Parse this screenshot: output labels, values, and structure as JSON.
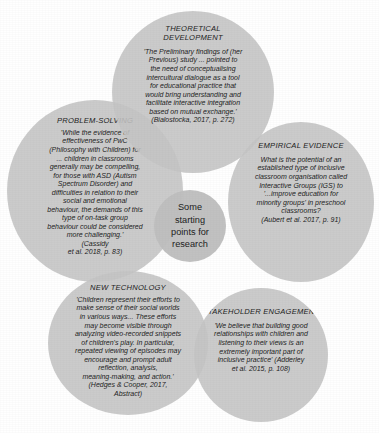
{
  "figure": {
    "center": {
      "label": "Some\nstarting\npoints for\nresearch"
    },
    "bubbles": [
      {
        "id": "theoretical-development",
        "heading": "THEORETICAL\nDEVELOPMENT",
        "quote": "'The Preliminary findings of (her\nPrevious) study ... pointed to\nthe need of conceptualising\nintercultural dialogue as a tool\nfor educational practice that\nwould bring understanding and\nfacilitate interactive integration\nbased on mutual exchange.'\n(Bialostocka, 2017, p. 272)"
      },
      {
        "id": "problem-solving",
        "heading": "PROBLEM-SOLVING",
        "quote": "'While the evidence of\neffectiveness of PwC\n(Philosophy with Children) for\n... children in classrooms\ngenerally may be compelling,\nfor those with ASD (Autism\nSpectrum Disorder) and\ndifficulties in relation to their\nsocial and emotional\nbehaviour, the demands of this\ntype of on-task group\nbehaviour could be considered\nmore challenging.'\n(Cassidy\net al. 2018, p. 83)"
      },
      {
        "id": "empirical-evidence",
        "heading": "EMPIRICAL EVIDENCE",
        "quote": "What is the potential of an\nestablished type of inclusive\nclassroom organisation called\nInteractive Groups (IGS) to\n'...improve education for\nminority groups' in preschool\nclassrooms?\n(Aubert et al. 2017, p. 91)"
      },
      {
        "id": "new-technology",
        "heading": "NEW TECHNOLOGY",
        "quote": "'Children represent their efforts to\nmake sense of their social worlds\nin various ways... These efforts\nmay become visible through\nanalyzing video-recorded snippets\nof children's play. In particular,\nrepeated viewing of episodes may\nencourage and prompt adult\nreflection, analysis,\nmeaning-making, and action.'\n(Hedges & Cooper, 2017,\nAbstract)"
      },
      {
        "id": "stakeholder-engagement",
        "heading": "STAKEHOLDER ENGAGEMENT",
        "quote": "'We believe that building good\nrelationships with children and\nlistening to their views is an\nextremely important part of\ninclusive practice' (Adderley\net al. 2015, p. 108)"
      }
    ]
  },
  "colors": {
    "background": "#ffffff",
    "bubble_fill": "#c4c4c4",
    "center_fill": "#bebebe",
    "text": "#1b1b1b"
  }
}
